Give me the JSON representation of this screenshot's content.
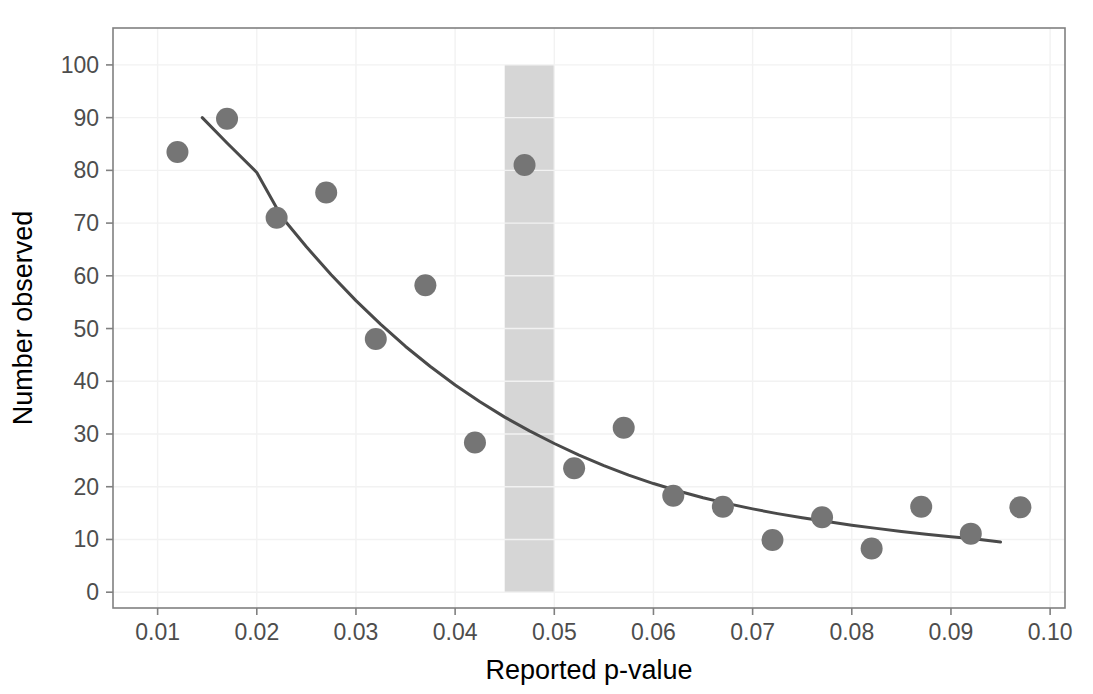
{
  "chart_data": {
    "type": "scatter",
    "title": "",
    "subtitle": "",
    "xlabel": "Reported p-value",
    "ylabel": "Number observed",
    "xlim": [
      0.0055,
      0.1015
    ],
    "ylim": [
      -3,
      107
    ],
    "xticks": [
      0.01,
      0.02,
      0.03,
      0.04,
      0.05,
      0.06,
      0.07,
      0.08,
      0.09,
      0.1
    ],
    "xtick_labels": [
      "0.01",
      "0.02",
      "0.03",
      "0.04",
      "0.05",
      "0.06",
      "0.07",
      "0.08",
      "0.09",
      "0.10"
    ],
    "yticks": [
      0,
      10,
      20,
      30,
      40,
      50,
      60,
      70,
      80,
      90,
      100
    ],
    "ytick_labels": [
      "0",
      "10",
      "20",
      "30",
      "40",
      "50",
      "60",
      "70",
      "80",
      "90",
      "100"
    ],
    "grid": true,
    "legend": "none",
    "series": [
      {
        "name": "Observed counts",
        "type": "scatter",
        "marker": "circle",
        "marker_size": 11,
        "color": "#757575",
        "x": [
          0.012,
          0.017,
          0.022,
          0.027,
          0.032,
          0.037,
          0.042,
          0.047,
          0.052,
          0.057,
          0.062,
          0.067,
          0.072,
          0.077,
          0.082,
          0.087,
          0.092,
          0.097
        ],
        "y": [
          83.5,
          89.8,
          71.0,
          75.8,
          48.0,
          58.2,
          28.4,
          81.0,
          23.5,
          31.2,
          18.3,
          16.2,
          9.9,
          14.2,
          8.3,
          16.2,
          11.1,
          16.1
        ]
      },
      {
        "name": "Fitted curve",
        "type": "line",
        "color": "#4a4a4a",
        "line_width": 3,
        "x": [
          0.0145,
          0.017,
          0.02,
          0.0225,
          0.025,
          0.0275,
          0.03,
          0.0325,
          0.035,
          0.0375,
          0.04,
          0.0425,
          0.045,
          0.0475,
          0.05,
          0.0525,
          0.055,
          0.0575,
          0.06,
          0.0625,
          0.065,
          0.0675,
          0.07,
          0.0725,
          0.075,
          0.0775,
          0.08,
          0.0825,
          0.085,
          0.0875,
          0.09,
          0.0925,
          0.095
        ],
        "y": [
          90.0,
          85.2,
          79.6,
          71.2,
          65.5,
          60.2,
          55.3,
          50.8,
          46.6,
          42.8,
          39.3,
          36.1,
          33.2,
          30.6,
          28.2,
          26.0,
          24.0,
          22.2,
          20.6,
          19.2,
          17.9,
          16.8,
          15.8,
          14.9,
          14.1,
          13.4,
          12.7,
          12.1,
          11.5,
          11.0,
          10.5,
          10.1,
          9.5
        ]
      }
    ],
    "annotations": [
      {
        "name": "significance-band",
        "type": "vertical-band",
        "x_start": 0.045,
        "x_end": 0.05,
        "y_start": 0,
        "y_end": 100,
        "color": "#d6d6d6"
      }
    ],
    "colors": {
      "point": "#757575",
      "curve": "#4a4a4a",
      "band": "#d6d6d6",
      "grid": "#f2f2f2",
      "panel_border": "#808080",
      "axis_text": "#4d4d4d",
      "title_text": "#000000",
      "background": "#ffffff"
    }
  }
}
